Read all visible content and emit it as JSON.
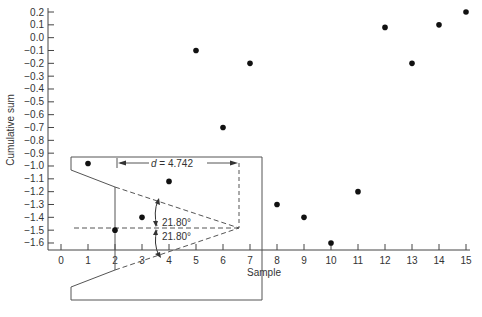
{
  "chart_data": {
    "type": "scatter",
    "title": "",
    "xlabel": "Sample",
    "ylabel": "Cumulative sum",
    "xlim": [
      0,
      15
    ],
    "ylim": [
      -1.6,
      0.2
    ],
    "grid": false,
    "x_ticks": [
      0,
      1,
      2,
      3,
      4,
      5,
      6,
      7,
      8,
      9,
      10,
      11,
      12,
      13,
      14,
      15
    ],
    "y_ticks": [
      0.2,
      0.1,
      0.0,
      -0.1,
      -0.2,
      -0.3,
      -0.4,
      -0.5,
      -0.6,
      -0.7,
      -0.8,
      -0.9,
      -1.0,
      -1.1,
      -1.2,
      -1.3,
      -1.4,
      -1.5,
      -1.6
    ],
    "y_tick_labels": [
      "0.2",
      "0.1",
      "0.0",
      "−0.1",
      "−0.2",
      "−0.3",
      "−0.4",
      "−0.5",
      "−0.6",
      "−0.7",
      "−0.8",
      "−0.9",
      "−1.0",
      "−1.1",
      "−1.2",
      "−1.3",
      "−1.4",
      "−1.5",
      "−1.6"
    ],
    "series": [
      {
        "name": "Cumulative sum",
        "x": [
          1,
          2,
          3,
          4,
          5,
          6,
          7,
          8,
          9,
          10,
          11,
          12,
          13,
          14,
          15
        ],
        "values": [
          -0.98,
          -1.5,
          -1.4,
          -1.12,
          -0.1,
          -0.7,
          -0.2,
          -1.3,
          -1.4,
          -1.6,
          -1.2,
          0.08,
          -0.2,
          0.1,
          0.2
        ]
      }
    ],
    "annotations": {
      "v_mask": {
        "lead_distance_label": "d = 4.742",
        "d_symbol": "d",
        "d_value": " = 4.742",
        "angle_upper": "21.80°",
        "angle_lower": "21.80°",
        "vertex_x": 6.742,
        "vertex_y": -1.5,
        "origin_sample": 2
      }
    }
  }
}
